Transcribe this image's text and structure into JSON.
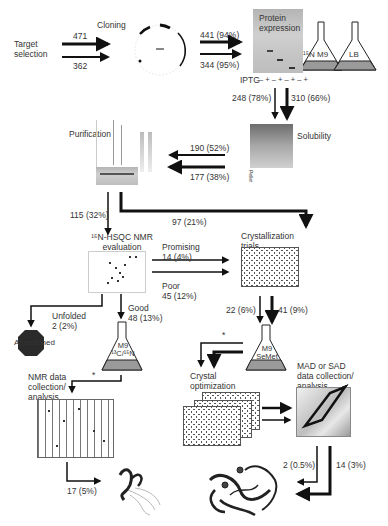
{
  "diagram": {
    "stages": {
      "target_selection": "Target\nselection",
      "cloning": "Cloning",
      "protein_expression": "Protein\nexpression",
      "iptg_label": "IPTG",
      "iptg_lanes": "– + – + – + – +",
      "flask_nm9": "¹⁵N M9",
      "flask_lb": "LB",
      "solubility": "Solubility",
      "solubility_lanes": [
        "Pellet",
        "Supernatant",
        "Pellet",
        "Supernatant",
        "Pellet",
        "Supernatant"
      ],
      "purification": "Purification",
      "hsqc": "¹⁵N-HSQC NMR\nevaluation",
      "crystallization_trials": "Crystallization\ntrials",
      "abandoned": "Abandoned",
      "flask_m9_13c15n": "M9\n¹³C/¹⁵N",
      "flask_m9_semet": "M9\nSeMet",
      "nmr_data": "NMR data\ncollection/\nanalysis",
      "crystal_optimization": "Crystal\noptimization",
      "mad_sad": "MAD or SAD\ndata collection/\nanalysis",
      "asterisk_1": "*",
      "asterisk_2": "*"
    },
    "flows": {
      "target_to_cloning_top": "471",
      "target_to_cloning_bottom": "362",
      "cloning_to_expression_top": "441 (94%)",
      "cloning_to_expression_bottom": "344 (95%)",
      "expression_to_solubility_left": "248 (78%)",
      "expression_to_solubility_right": "310 (66%)",
      "solubility_to_purification_top": "190 (52%)",
      "solubility_to_purification_bottom": "177 (38%)",
      "purification_to_nmr": "115 (32%)",
      "purification_to_crystallization": "97 (21%)",
      "nmr_promising": "Promising\n14 (4%)",
      "nmr_poor": "Poor\n45 (12%)",
      "nmr_unfolded": "Unfolded\n2 (2%)",
      "nmr_good": "Good\n48 (13%)",
      "crystal_to_semet_left": "22 (6%)",
      "crystal_to_semet_right": "41 (9%)",
      "nmr_structures": "17 (5%)",
      "xray_structures_left": "2 (0.5%)",
      "xray_structures_right": "14 (3%)"
    },
    "colors": {
      "arrow": "#111111",
      "flask_media": "#9a9a9a",
      "abandoned": "#2a2a2a",
      "gel": "#bdbdbd"
    }
  }
}
